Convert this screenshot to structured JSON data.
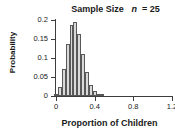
{
  "chart_data": {
    "type": "bar",
    "title_prefix": "Sample Size",
    "title_var": "n",
    "title_eq": "= 25",
    "xlabel": "Proportion of Children",
    "ylabel": "Probability",
    "xlim": [
      0,
      1.2
    ],
    "ylim": [
      0,
      0.2
    ],
    "grid": false,
    "legend": null,
    "bar_fill_color": "#d9d9d9",
    "bar_edge_color": "#585858",
    "axis_color": "#3d3d3d",
    "text_color": "#1a1a1a",
    "xticks": [
      0,
      0.4,
      0.8,
      1.2
    ],
    "xtick_labels": [
      "0",
      "0.4",
      "0.8",
      "1.2"
    ],
    "yticks": [
      0,
      0.05,
      0.1,
      0.15,
      0.2
    ],
    "ytick_labels": [
      "0",
      "0.05",
      "0.1",
      "0.15",
      "0.2"
    ],
    "bar_width": 0.04,
    "categories": [
      0.0,
      0.04,
      0.08,
      0.12,
      0.16,
      0.2,
      0.24,
      0.28,
      0.32,
      0.36,
      0.4,
      0.44,
      0.48
    ],
    "values": [
      0.004,
      0.024,
      0.071,
      0.136,
      0.187,
      0.196,
      0.163,
      0.111,
      0.062,
      0.029,
      0.012,
      0.004,
      0.001
    ]
  }
}
